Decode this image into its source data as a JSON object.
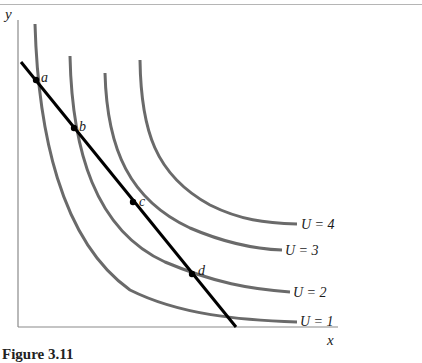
{
  "figure": {
    "axes": {
      "x_label": "x",
      "y_label": "y"
    },
    "budget_line": {
      "color": "#000000"
    },
    "curve_color": "#6a6a6a",
    "points": [
      {
        "label": "a",
        "x": 36,
        "y": 80
      },
      {
        "label": "b",
        "x": 74,
        "y": 128
      },
      {
        "label": "c",
        "x": 133,
        "y": 202
      },
      {
        "label": "d",
        "x": 192,
        "y": 274
      }
    ],
    "curves": [
      {
        "label": "U = 1"
      },
      {
        "label": "U = 2"
      },
      {
        "label": "U = 3"
      },
      {
        "label": "U = 4"
      }
    ],
    "caption": {
      "number": "Figure 3.11",
      "title": "Corners ... (caption partially cut off)"
    }
  }
}
